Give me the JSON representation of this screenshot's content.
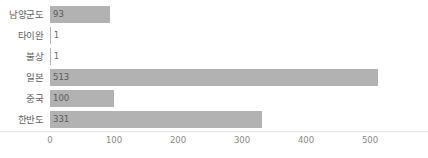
{
  "chart_data": {
    "type": "bar",
    "orientation": "horizontal",
    "title": "",
    "subtitle": "",
    "xlabel": "",
    "ylabel": "",
    "categories": [
      "남양군도",
      "타이완",
      "불상",
      "일본",
      "중국",
      "한반도"
    ],
    "values": [
      93,
      1,
      1,
      513,
      100,
      331
    ],
    "value_labels": [
      "93",
      "1",
      "1",
      "513",
      "100",
      "331"
    ],
    "xticks": [
      0,
      100,
      200,
      300,
      400,
      500
    ],
    "xtick_labels": [
      "0",
      "100",
      "200",
      "300",
      "400",
      "500"
    ],
    "xlim": [
      0,
      590
    ],
    "grid": false,
    "legend": null,
    "legend_position": "none",
    "bar_color": "#b2b2b2",
    "axis_color": "#e2e2e2",
    "label_color": "#5e5e5e",
    "tick_color": "#888888"
  }
}
